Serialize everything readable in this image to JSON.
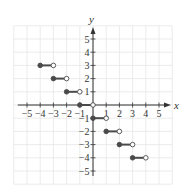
{
  "chart_data": {
    "type": "line",
    "subtype": "step-function",
    "title": "",
    "xlabel": "x",
    "ylabel": "y",
    "xlim": [
      -6,
      6
    ],
    "ylim": [
      -6,
      6
    ],
    "grid": true,
    "legend": null,
    "x_ticks": [
      -5,
      -4,
      -3,
      -2,
      -1,
      1,
      2,
      3,
      4,
      5
    ],
    "y_ticks": [
      -5,
      -4,
      -3,
      -2,
      -1,
      1,
      2,
      3,
      4,
      5
    ],
    "x_tick_labels": [
      "−5",
      "−4",
      "−3",
      "−2",
      "−1",
      "1",
      "2",
      "3",
      "4",
      "5"
    ],
    "y_tick_labels": [
      "5",
      "4",
      "3",
      "2",
      "1",
      "−1",
      "−2",
      "−3",
      "−4",
      "−5"
    ],
    "series": [
      {
        "name": "step",
        "segments": [
          {
            "x_start": -4,
            "x_end": -3,
            "y": 3,
            "start_closed": true,
            "end_closed": false
          },
          {
            "x_start": -3,
            "x_end": -2,
            "y": 2,
            "start_closed": true,
            "end_closed": false
          },
          {
            "x_start": -2,
            "x_end": -1,
            "y": 1,
            "start_closed": true,
            "end_closed": false
          },
          {
            "x_start": -1,
            "x_end": 0,
            "y": 0,
            "start_closed": true,
            "end_closed": false
          },
          {
            "x_start": 0,
            "x_end": 1,
            "y": -1,
            "start_closed": true,
            "end_closed": false
          },
          {
            "x_start": 1,
            "x_end": 2,
            "y": -2,
            "start_closed": true,
            "end_closed": false
          },
          {
            "x_start": 2,
            "x_end": 3,
            "y": -3,
            "start_closed": true,
            "end_closed": false
          },
          {
            "x_start": 3,
            "x_end": 4,
            "y": -4,
            "start_closed": true,
            "end_closed": false
          }
        ]
      }
    ],
    "colors": {
      "grid": "#e6e6e6",
      "axis": "#333333",
      "segment": "#4a4a4a"
    }
  }
}
